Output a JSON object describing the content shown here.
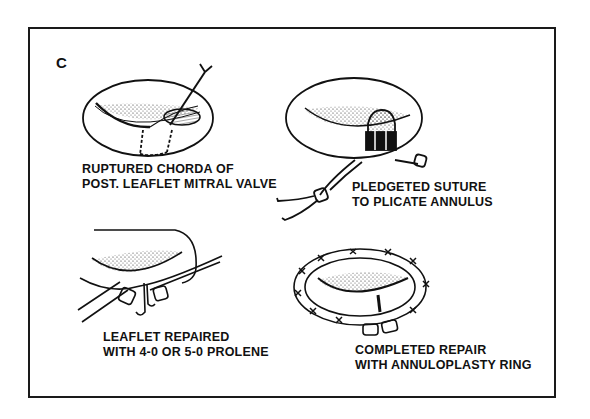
{
  "figure": {
    "panel_label": "C",
    "panels": [
      {
        "id": "ruptured-chorda",
        "caption_lines": [
          "RUPTURED CHORDA OF",
          "POST. LEAFLET MITRAL VALVE"
        ]
      },
      {
        "id": "pledgeted-suture",
        "caption_lines": [
          "PLEDGETED SUTURE",
          "TO PLICATE ANNULUS"
        ]
      },
      {
        "id": "leaflet-repaired",
        "caption_lines": [
          "LEAFLET REPAIRED",
          "WITH 4-0 OR 5-0 PROLENE"
        ]
      },
      {
        "id": "completed-repair",
        "caption_lines": [
          "COMPLETED REPAIR",
          "WITH ANNULOPLASTY RING"
        ]
      }
    ],
    "colors": {
      "ink": "#111111",
      "background": "#ffffff",
      "frame": "#1a1a1a"
    }
  }
}
